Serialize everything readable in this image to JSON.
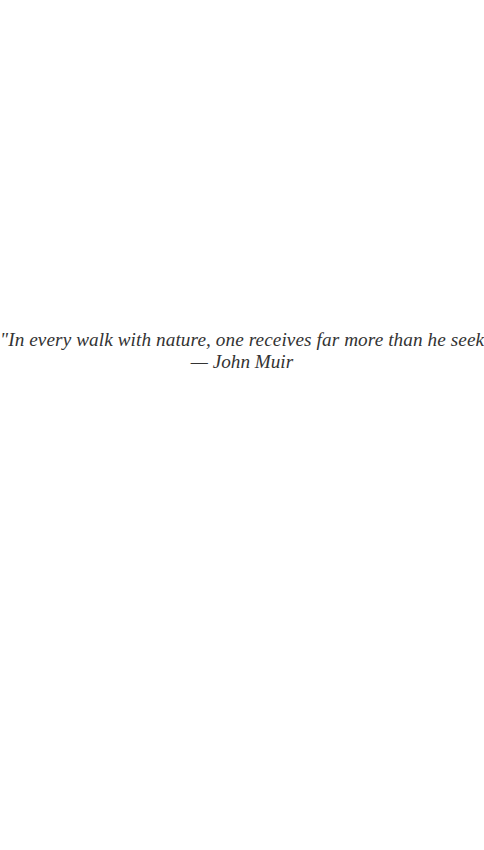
{
  "quote": {
    "text": "\"In every walk with nature, one receives far more than he seeks.\"",
    "author": "— John Muir"
  },
  "colors": {
    "background": "#ffffff",
    "text": "#333333"
  }
}
